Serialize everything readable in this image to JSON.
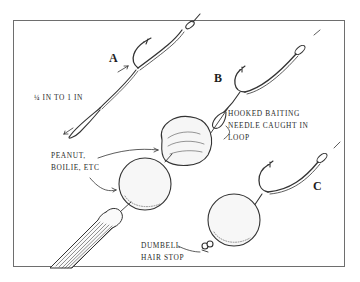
{
  "figure": {
    "panels": [
      {
        "id": "A",
        "letter": "A"
      },
      {
        "id": "B",
        "letter": "B"
      },
      {
        "id": "C",
        "letter": "C"
      }
    ],
    "labels": {
      "hair_length": "¼ IN TO 1 IN",
      "hooked_needle": [
        "HOOKED BAITING",
        "NEEDLE CAUGHT IN",
        "LOOP"
      ],
      "bait": [
        "PEANUT,",
        "BOILIE, ETC"
      ],
      "hair_stop": [
        "DUMBELL",
        "HAIR STOP"
      ]
    },
    "colors": {
      "ink": "#2a2a2a",
      "frame": "#6e6e6e",
      "background": "#ffffff"
    }
  }
}
